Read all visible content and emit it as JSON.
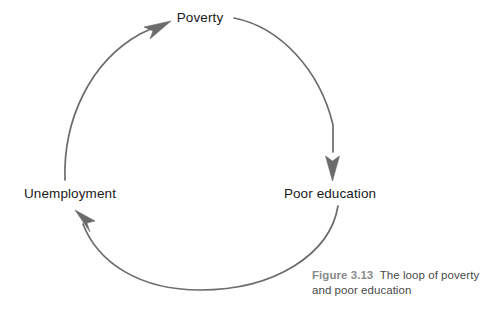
{
  "figure": {
    "caption_number": "Figure 3.13",
    "caption_text": "The loop of poverty and poor education",
    "background_color": "#ffffff",
    "line_color": "#6b6b6b",
    "label_color": "#1a1a1a",
    "caption_number_color": "#8a8a8a",
    "caption_text_color": "#4a4a4a"
  },
  "diagram": {
    "type": "cycle",
    "direction": "clockwise",
    "nodes": [
      {
        "id": "poverty",
        "label": "Poverty",
        "position": "top"
      },
      {
        "id": "poor-education",
        "label": "Poor education",
        "position": "right"
      },
      {
        "id": "unemployment",
        "label": "Unemployment",
        "position": "left"
      }
    ],
    "edges": [
      {
        "from": "poverty",
        "to": "poor-education",
        "arrow": "down"
      },
      {
        "from": "poor-education",
        "to": "unemployment",
        "arrow": "up-left"
      },
      {
        "from": "unemployment",
        "to": "poverty",
        "arrow": "up-right"
      }
    ],
    "geometry": {
      "center_x": 200,
      "center_y": 155,
      "radius": 137
    }
  }
}
